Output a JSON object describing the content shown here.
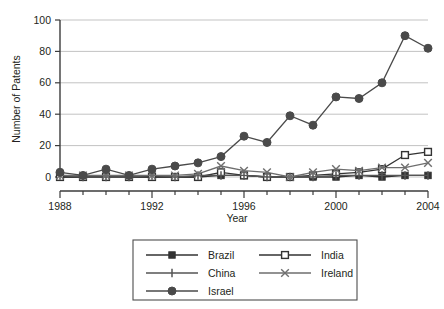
{
  "chart_data": {
    "type": "line",
    "title": "",
    "xlabel": "Year",
    "ylabel": "Number of Patents",
    "x": [
      1988,
      1989,
      1990,
      1991,
      1992,
      1993,
      1994,
      1995,
      1996,
      1997,
      1998,
      1999,
      2000,
      2001,
      2002,
      2003,
      2004
    ],
    "xtick_labels": [
      "1988",
      "1992",
      "1996",
      "2000",
      "2004"
    ],
    "xticks": [
      1988,
      1992,
      1996,
      2000,
      2004
    ],
    "ytick_labels": [
      "0",
      "20",
      "40",
      "60",
      "80",
      "100"
    ],
    "yticks": [
      0,
      20,
      40,
      60,
      80,
      100
    ],
    "xlim": [
      1988,
      2004
    ],
    "ylim": [
      0,
      100
    ],
    "grid": "horizontal",
    "legend_position": "below-plot",
    "series": [
      {
        "name": "Brazil",
        "marker": "filled-square",
        "color": "#333333",
        "values": [
          0,
          0,
          0,
          0,
          0,
          0,
          0,
          1,
          1,
          0,
          0,
          0,
          0,
          1,
          0,
          1,
          1
        ]
      },
      {
        "name": "India",
        "marker": "open-square",
        "color": "#333333",
        "values": [
          0,
          0,
          0,
          0,
          0,
          0,
          0,
          3,
          1,
          0,
          0,
          1,
          2,
          3,
          5,
          14,
          16
        ]
      },
      {
        "name": "China",
        "marker": "vertical-bar",
        "color": "#555555",
        "values": [
          1,
          0,
          0,
          0,
          1,
          0,
          1,
          1,
          1,
          0,
          0,
          0,
          1,
          1,
          1,
          1,
          1
        ]
      },
      {
        "name": "Ireland",
        "marker": "cross-x",
        "color": "#6e6e6e",
        "values": [
          1,
          1,
          1,
          1,
          1,
          1,
          2,
          7,
          4,
          3,
          0,
          3,
          5,
          4,
          6,
          6,
          9
        ]
      },
      {
        "name": "Israel",
        "marker": "filled-circle",
        "color": "#4a4a4a",
        "values": [
          3,
          1,
          5,
          1,
          5,
          7,
          9,
          13,
          26,
          22,
          39,
          33,
          51,
          50,
          60,
          90,
          82
        ]
      }
    ]
  },
  "legend": {
    "entries": [
      {
        "label": "Brazil"
      },
      {
        "label": "India"
      },
      {
        "label": "China"
      },
      {
        "label": "Ireland"
      },
      {
        "label": "Israel"
      }
    ]
  },
  "colors": {
    "axis": "#3b3b3b",
    "grid": "#a9a9a9",
    "text": "#231f20",
    "background": "#ffffff"
  }
}
